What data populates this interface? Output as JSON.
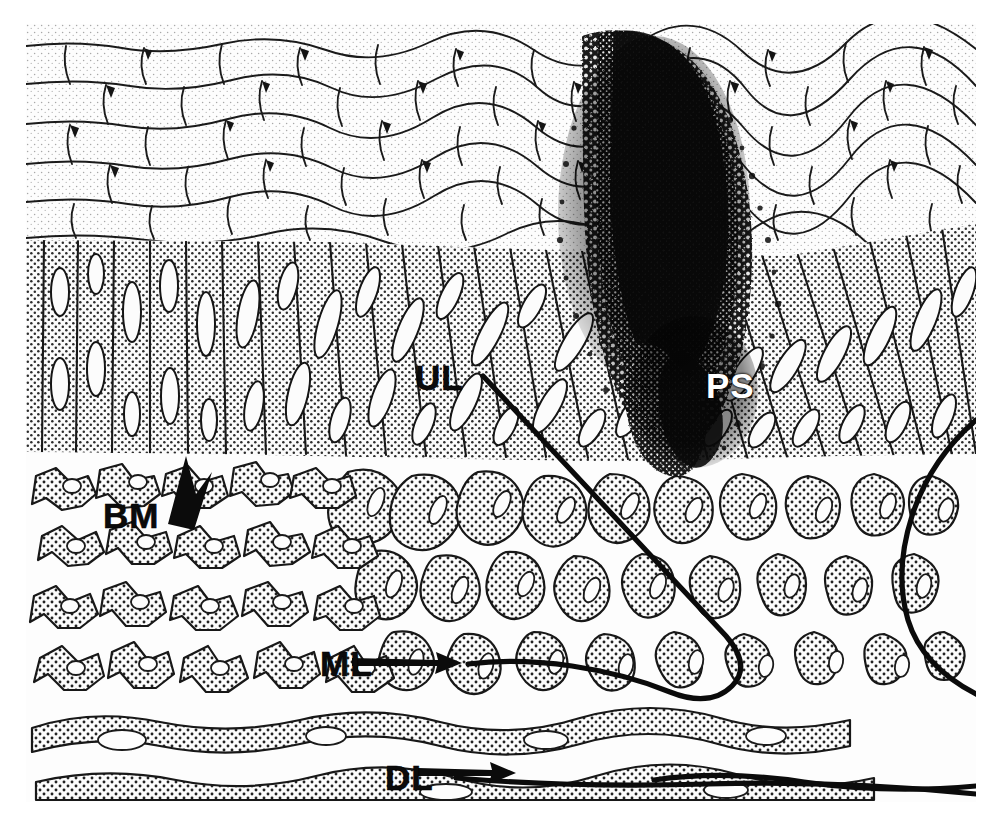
{
  "figure": {
    "type": "histological-line-drawing",
    "width": 989,
    "height": 816,
    "background_color": "#ffffff",
    "ink_color": "#111111"
  },
  "labels": [
    {
      "id": "UL",
      "text": "UL",
      "meaning": "upper layer",
      "style": "black",
      "x": 389,
      "y": 336,
      "leader": {
        "type": "line-curve",
        "from": [
          480,
          372
        ],
        "to": [
          470,
          663
        ],
        "arrow": true
      }
    },
    {
      "id": "PS",
      "text": "PS",
      "meaning": "pigmented spot",
      "style": "white-knockout",
      "x": 680,
      "y": 344,
      "leader": {
        "type": "none",
        "arrow": false
      }
    },
    {
      "id": "BM",
      "text": "BM",
      "meaning": "basement membrane",
      "style": "black",
      "x": 77,
      "y": 474,
      "leader": {
        "type": "arrow-up",
        "from": [
          168,
          520
        ],
        "to": [
          183,
          456
        ],
        "arrow": true
      }
    },
    {
      "id": "ML",
      "text": "ML",
      "meaning": "middle layer",
      "style": "black",
      "x": 294,
      "y": 622,
      "leader": {
        "type": "arrow-right",
        "from": [
          352,
          660
        ],
        "to": [
          432,
          662
        ],
        "arrow": true
      }
    },
    {
      "id": "DL",
      "text": "DL",
      "meaning": "deep layer",
      "style": "black",
      "x": 359,
      "y": 736,
      "leader": {
        "type": "arrow-right",
        "from": [
          418,
          770
        ],
        "to": [
          487,
          771
        ],
        "arrow": true
      }
    }
  ],
  "regions": [
    {
      "name": "squamous-layer",
      "label_ref": "UL",
      "top": 24,
      "bottom": 245,
      "stipple": "fine-light",
      "cells": "flattened polygonal",
      "note": "outermost flattened cells"
    },
    {
      "name": "columnar-layer",
      "label_ref": "ML",
      "top": 245,
      "bottom": 448,
      "stipple": "medium",
      "cells": "tall columnar with elongate nuclei"
    },
    {
      "name": "basement-membrane",
      "label_ref": "BM",
      "top": 448,
      "bottom": 458,
      "stipple": "dashed-line",
      "cells": "thin basal lamina"
    },
    {
      "name": "connective-tissue",
      "label_ref": "DL",
      "top": 458,
      "bottom": 802,
      "stipple": "coarse-dot",
      "cells": "stellate fibroblasts in loose matrix"
    },
    {
      "name": "pigmented-mass",
      "label_ref": "PS",
      "top": 30,
      "bottom": 450,
      "stipple": "dense-black-granular",
      "cells": "melanin-laden pigment aggregate"
    }
  ],
  "colors": {
    "ink": "#111111",
    "stipple_light": "#b9b9b9",
    "stipple_medium": "#8e8e8e",
    "stipple_dark": "#1a1a1a",
    "paper": "#fdfdfd",
    "knockout_text": "#ffffff"
  }
}
